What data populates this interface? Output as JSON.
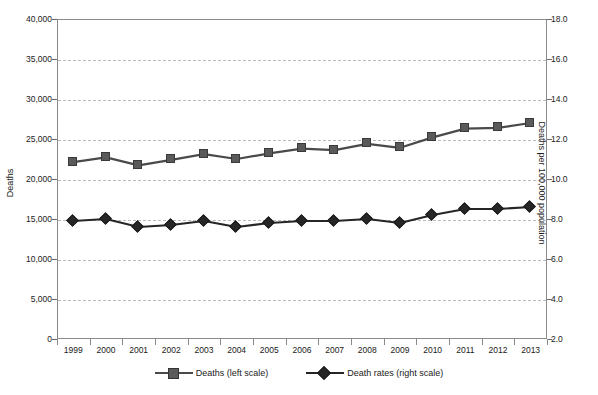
{
  "chart_data": {
    "type": "line",
    "title": "",
    "xlabel": "",
    "ylabel": "Deaths",
    "ylabel_right": "Deaths per 100,000 population",
    "grid": true,
    "legend_position": "bottom",
    "categories": [
      "1999",
      "2000",
      "2001",
      "2002",
      "2003",
      "2004",
      "2005",
      "2006",
      "2007",
      "2008",
      "2009",
      "2010",
      "2011",
      "2012",
      "2013"
    ],
    "ylim": [
      0,
      40000
    ],
    "yticks": [
      "0",
      "5,000",
      "10,000",
      "15,000",
      "20,000",
      "25,000",
      "30,000",
      "35,000",
      "40,000"
    ],
    "ylim_right": [
      2.0,
      18.0
    ],
    "yticks_right": [
      "2.0",
      "4.0",
      "6.0",
      "8.0",
      "10.0",
      "12.0",
      "14.0",
      "16.0",
      "18.0"
    ],
    "series": [
      {
        "name": "Deaths (left scale)",
        "axis": "left",
        "marker": "square",
        "color": "#5a5a5a",
        "values": [
          22100,
          22700,
          21700,
          22400,
          23100,
          22500,
          23200,
          23800,
          23600,
          24400,
          23900,
          25200,
          26300,
          26400,
          27000
        ]
      },
      {
        "name": "Death rates (right scale)",
        "axis": "right",
        "marker": "diamond",
        "color": "#262626",
        "values": [
          7.9,
          8.0,
          7.6,
          7.7,
          7.9,
          7.6,
          7.8,
          7.9,
          7.9,
          8.0,
          7.8,
          8.2,
          8.5,
          8.5,
          8.6
        ]
      }
    ]
  },
  "legend": {
    "items": [
      {
        "label": "Deaths (left scale)",
        "marker": "square"
      },
      {
        "label": "Death rates (right scale)",
        "marker": "diamond"
      }
    ]
  },
  "colors": {
    "square_fill": "#5a5a5a",
    "square_border": "#3a3a3a",
    "diamond_fill": "#262626",
    "line_left": "#4a4a4a",
    "line_right": "#262626",
    "gridline": "#b9b9c4",
    "axis": "#8a8a8a",
    "text": "#1a1a1a"
  }
}
